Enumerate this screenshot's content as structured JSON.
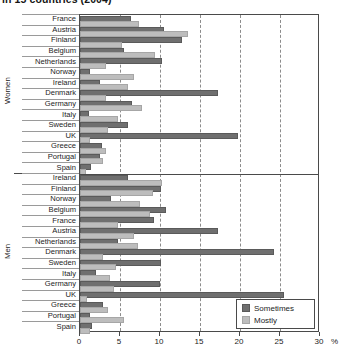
{
  "title": "in 15 countries (2004)",
  "axis": {
    "x_ticks": [
      "0",
      "5",
      "10",
      "15",
      "20",
      "25",
      "30"
    ],
    "x_unit": "%",
    "xmin": 0,
    "xmax": 30
  },
  "legend": {
    "position": "bottom-right",
    "items": [
      {
        "label": "Sometimes",
        "color": "#6f6f6f"
      },
      {
        "label": "Mostly",
        "color": "#bdbdbd"
      }
    ]
  },
  "groups": [
    {
      "name": "Women"
    },
    {
      "name": "Men"
    }
  ],
  "chart_data": {
    "type": "bar",
    "orientation": "horizontal",
    "title": "in 15 countries (2004)",
    "xlabel": "%",
    "ylabel": "",
    "xlim": [
      0,
      30
    ],
    "grid": true,
    "legend_position": "bottom-right",
    "series": [
      {
        "name": "Sometimes",
        "color": "#6f6f6f"
      },
      {
        "name": "Mostly",
        "color": "#bdbdbd"
      }
    ],
    "panels": [
      {
        "group": "Women",
        "categories": [
          "France",
          "Austria",
          "Finland",
          "Belgium",
          "Netherlands",
          "Norway",
          "Ireland",
          "Denmark",
          "Germany",
          "Italy",
          "Sweden",
          "UK",
          "Greece",
          "Portugal",
          "Spain"
        ],
        "series": [
          {
            "name": "Sometimes",
            "values": [
              6.1,
              10.2,
              12.5,
              5.3,
              10.0,
              1.0,
              2.2,
              17.0,
              6.2,
              0.9,
              5.8,
              19.5,
              2.5,
              2.2,
              1.1
            ]
          },
          {
            "name": "Mostly",
            "values": [
              7.1,
              13.2,
              5.0,
              9.1,
              3.0,
              6.5,
              5.8,
              3.0,
              7.5,
              4.5,
              3.2,
              1.0,
              3.0,
              2.6,
              0.5
            ]
          }
        ]
      },
      {
        "group": "Men",
        "categories": [
          "Ireland",
          "Finland",
          "Norway",
          "Belgium",
          "France",
          "Austria",
          "Netherlands",
          "Denmark",
          "Sweden",
          "Italy",
          "Germany",
          "UK",
          "Greece",
          "Portugal",
          "Spain"
        ],
        "series": [
          {
            "name": "Sometimes",
            "values": [
              5.8,
              9.9,
              3.6,
              10.5,
              9.0,
              17.0,
              4.5,
              24.0,
              9.9,
              1.8,
              9.7,
              25.2,
              2.6,
              1.0,
              1.2
            ]
          },
          {
            "name": "Mostly",
            "values": [
              10.0,
              8.9,
              7.3,
              8.5,
              4.5,
              6.5,
              7.0,
              2.6,
              4.3,
              3.5,
              4.0,
              0.6,
              3.2,
              5.2,
              1.0
            ]
          }
        ]
      }
    ]
  }
}
